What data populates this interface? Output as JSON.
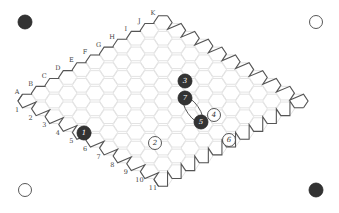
{
  "board": {
    "size": 11,
    "column_labels": [
      "A",
      "B",
      "C",
      "D",
      "E",
      "F",
      "G",
      "H",
      "I",
      "J",
      "K"
    ],
    "row_labels": [
      "1",
      "2",
      "3",
      "4",
      "5",
      "6",
      "7",
      "8",
      "9",
      "10",
      "11"
    ],
    "colors": {
      "black": "#333333",
      "white": "#ffffff",
      "grid": "#dcdcdc",
      "edge": "#555555"
    }
  },
  "corner_markers": [
    {
      "position": "top-left",
      "color": "black"
    },
    {
      "position": "top-right",
      "color": "white"
    },
    {
      "position": "bottom-left",
      "color": "white"
    },
    {
      "position": "bottom-right",
      "color": "black"
    }
  ],
  "moves": [
    {
      "number": "1",
      "color": "black"
    },
    {
      "number": "2",
      "color": "white"
    },
    {
      "number": "3",
      "color": "black"
    },
    {
      "number": "4",
      "color": "white"
    },
    {
      "number": "5",
      "color": "black"
    },
    {
      "number": "6",
      "color": "white"
    },
    {
      "number": "7",
      "color": "black"
    }
  ],
  "annotations": [
    {
      "type": "bridge-link",
      "between": [
        "7",
        "5"
      ]
    }
  ]
}
